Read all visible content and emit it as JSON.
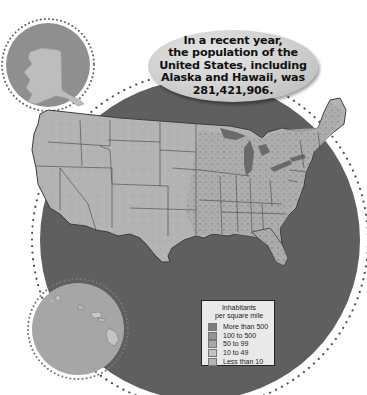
{
  "callout": {
    "lines": [
      "In a recent year,",
      "the population of the",
      "United States, including",
      "Alaska and Hawaii, was",
      "281,421,906."
    ]
  },
  "legend": {
    "title_line1": "Inhabitants",
    "title_line2": "per square mile",
    "items": [
      {
        "label": "More than 500",
        "color": "#7d7d7d"
      },
      {
        "label": "100 to 500",
        "color": "#939393"
      },
      {
        "label": "50 to 99",
        "color": "#a8a8a8"
      },
      {
        "label": "10 to 49",
        "color": "#c2c2c2"
      },
      {
        "label": "Less than 10",
        "color": "#b3b3b3"
      }
    ]
  },
  "insets": {
    "alaska": "Alaska",
    "hawaii": "Hawaii"
  },
  "colors": {
    "ocean_dark": "#5f5f5f",
    "inset_bg": "#8f8f8f",
    "land": "#b1b1b1",
    "land_dense": "#8c8c8c",
    "border": "#3d3d3d",
    "dots": "#555555"
  }
}
